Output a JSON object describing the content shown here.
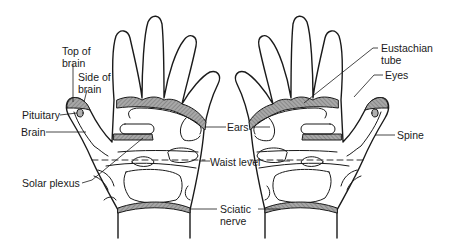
{
  "diagram": {
    "hands": [
      "left-hand-palm",
      "right-hand-palm"
    ],
    "colors": {
      "line": "#1a1a1a",
      "shade": "#9a9a9a",
      "background": "#ffffff"
    },
    "labels": {
      "top_of_brain": {
        "line1": "Top of",
        "line2": "brain"
      },
      "side_of_brain": {
        "line1": "Side of",
        "line2": "brain"
      },
      "pituitary": {
        "text": "Pituitary"
      },
      "brain": {
        "text": "Brain"
      },
      "solar_plexus": {
        "text": "Solar plexus"
      },
      "ears": {
        "text": "Ears"
      },
      "waist_level": {
        "text": "Waist level"
      },
      "sciatic_nerve": {
        "line1": "Sciatic",
        "line2": "nerve"
      },
      "eustachian_tube": {
        "line1": "Eustachian",
        "line2": "tube"
      },
      "eyes": {
        "text": "Eyes"
      },
      "spine": {
        "text": "Spine"
      }
    }
  }
}
